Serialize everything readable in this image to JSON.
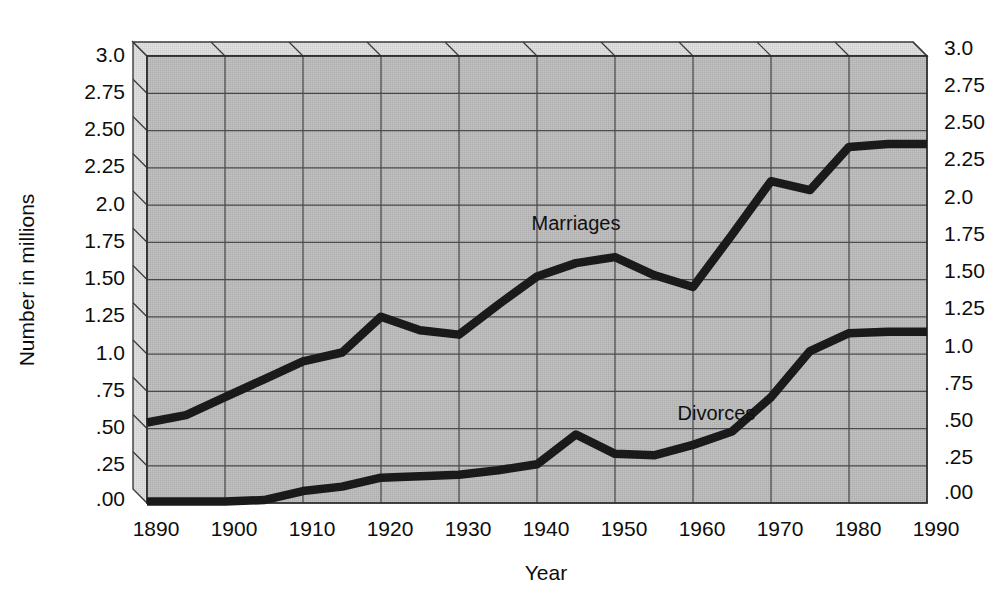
{
  "chart_data": {
    "type": "line",
    "title": "",
    "subtitle": "",
    "xlabel": "Year",
    "ylabel": "Number in millions",
    "xlim": [
      1890,
      1990
    ],
    "ylim": [
      0.0,
      3.0
    ],
    "grid": true,
    "legend_position": "inline-annotations",
    "x_ticks": [
      1890,
      1900,
      1910,
      1920,
      1930,
      1940,
      1950,
      1960,
      1970,
      1980,
      1990
    ],
    "x_tick_labels": [
      "1890",
      "1900",
      "1910",
      "1920",
      "1930",
      "1940",
      "1950",
      "1960",
      "1970",
      "1980",
      "1990"
    ],
    "y_ticks": [
      3.0,
      2.75,
      2.5,
      2.25,
      2.0,
      1.75,
      1.5,
      1.25,
      1.0,
      0.75,
      0.5,
      0.25,
      0.0
    ],
    "y_tick_labels": [
      "3.0",
      "2.75",
      "2.50",
      "2.25",
      "2.0",
      "1.75",
      "1.50",
      "1.25",
      "1.0",
      ".75",
      ".50",
      ".25",
      ".00"
    ],
    "y_tick_labels_right": [
      "3.0",
      "2.75",
      "2.50",
      "2.25",
      "2.0",
      "1.75",
      "1.50",
      "1.25",
      "1.0",
      ".75",
      ".50",
      ".25",
      ".00"
    ],
    "annotations": [
      {
        "name": "marriages",
        "text": "Marriages",
        "x": 1945,
        "y": 1.83
      },
      {
        "name": "divorces",
        "text": "Divorces",
        "x": 1963,
        "y": 0.56
      }
    ],
    "series": [
      {
        "name": "Marriages",
        "label": "Marriages",
        "color": "#1a1a1a",
        "x": [
          1890,
          1895,
          1900,
          1905,
          1910,
          1915,
          1920,
          1925,
          1930,
          1935,
          1940,
          1945,
          1950,
          1955,
          1960,
          1965,
          1970,
          1975,
          1980,
          1985,
          1990
        ],
        "values": [
          0.54,
          0.59,
          0.71,
          0.83,
          0.95,
          1.01,
          1.25,
          1.16,
          1.13,
          1.33,
          1.52,
          1.61,
          1.65,
          1.53,
          1.45,
          1.8,
          2.16,
          2.1,
          2.39,
          2.41,
          2.41
        ]
      },
      {
        "name": "Divorces",
        "label": "Divorces",
        "color": "#1a1a1a",
        "x": [
          1890,
          1895,
          1900,
          1905,
          1910,
          1915,
          1920,
          1925,
          1930,
          1935,
          1940,
          1945,
          1950,
          1955,
          1960,
          1965,
          1970,
          1975,
          1980,
          1985,
          1990
        ],
        "values": [
          0.01,
          0.01,
          0.01,
          0.02,
          0.08,
          0.11,
          0.17,
          0.18,
          0.19,
          0.22,
          0.26,
          0.46,
          0.33,
          0.32,
          0.39,
          0.48,
          0.71,
          1.02,
          1.14,
          1.15,
          1.15
        ]
      }
    ]
  },
  "axis": {
    "ylabel": "Number in millions",
    "xlabel": "Year"
  },
  "style": {
    "plot_fill": "#b4b4b4",
    "grid_color": "#4a4a4a",
    "frame_color": "#3a3a3a",
    "side_face": "#d5d5d5",
    "line_color": "#1a1a1a",
    "text_color": "#0d0d0d"
  }
}
